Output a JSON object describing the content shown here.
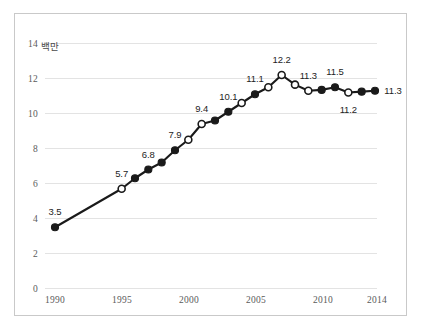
{
  "figure": {
    "background": "#ffffff",
    "frame_color": "#c9c9c9",
    "grid_color": "#e3e3e3",
    "line_color": "#1a1a1a",
    "marker_fill_color": "#1a1a1a",
    "marker_open_color": "#ffffff",
    "tick_color": "#5a5a5a"
  },
  "axis": {
    "y_unit_label": "백만",
    "y_ticks": [
      "0",
      "2",
      "4",
      "6",
      "8",
      "10",
      "12",
      "14"
    ],
    "x_ticks": [
      "1990",
      "1995",
      "2000",
      "2005",
      "2010",
      "2014"
    ]
  },
  "chart_data": {
    "type": "line",
    "title": "",
    "subtitle": "",
    "xlabel": "",
    "ylabel": "백만",
    "xlim": [
      1990,
      2014
    ],
    "ylim": [
      0,
      14
    ],
    "ytick_values": [
      0,
      2,
      4,
      6,
      8,
      10,
      12,
      14
    ],
    "xtick_values": [
      1990,
      1995,
      2000,
      2005,
      2010,
      2014
    ],
    "grid": "horizontal",
    "legend": "none",
    "series": [
      {
        "name": "백만",
        "x": [
          1990,
          1995,
          1996,
          1997,
          1998,
          1999,
          2000,
          2001,
          2002,
          2003,
          2004,
          2005,
          2006,
          2007,
          2008,
          2009,
          2010,
          2011,
          2012,
          2013,
          2014
        ],
        "values": [
          3.5,
          5.7,
          6.3,
          6.8,
          7.2,
          7.9,
          8.5,
          9.4,
          9.6,
          10.1,
          10.6,
          11.1,
          11.5,
          12.2,
          11.65,
          11.3,
          11.35,
          11.5,
          11.2,
          11.25,
          11.3
        ],
        "marker_styles": [
          "filled",
          "open",
          "filled",
          "filled",
          "filled",
          "filled",
          "open",
          "open",
          "filled",
          "filled",
          "open",
          "filled",
          "open",
          "open",
          "open",
          "open",
          "filled",
          "filled",
          "open",
          "filled",
          "filled"
        ]
      }
    ],
    "annotations": [
      {
        "text": "3.5",
        "x": 1990,
        "y": 3.5,
        "dx": 0,
        "dy": -15
      },
      {
        "text": "5.7",
        "x": 1995,
        "y": 5.7,
        "dx": 0,
        "dy": -15
      },
      {
        "text": "6.8",
        "x": 1997,
        "y": 6.8,
        "dx": 0,
        "dy": -15
      },
      {
        "text": "7.9",
        "x": 1999,
        "y": 7.9,
        "dx": 0,
        "dy": -15
      },
      {
        "text": "9.4",
        "x": 2001,
        "y": 9.4,
        "dx": 0,
        "dy": -15
      },
      {
        "text": "10.1",
        "x": 2003,
        "y": 10.1,
        "dx": 0,
        "dy": -15
      },
      {
        "text": "11.1",
        "x": 2005,
        "y": 11.1,
        "dx": 0,
        "dy": -15
      },
      {
        "text": "12.2",
        "x": 2007,
        "y": 12.2,
        "dx": 0,
        "dy": -15
      },
      {
        "text": "11.3",
        "x": 2009,
        "y": 11.3,
        "dx": 0,
        "dy": -15
      },
      {
        "text": "11.5",
        "x": 2011,
        "y": 11.5,
        "dx": 0,
        "dy": -15
      },
      {
        "text": "11.2",
        "x": 2012,
        "y": 11.2,
        "dx": 0,
        "dy": 17
      },
      {
        "text": "11.3",
        "x": 2014,
        "y": 11.3,
        "dx": 18,
        "dy": 0
      }
    ]
  },
  "labels": {
    "y0": "0",
    "y2": "2",
    "y4": "4",
    "y6": "6",
    "y8": "8",
    "y10": "10",
    "y12": "12",
    "y14": "14",
    "x1990": "1990",
    "x1995": "1995",
    "x2000": "2000",
    "x2005": "2005",
    "x2010": "2010",
    "x2014": "2014",
    "unit": "백만",
    "p3_5": "3.5",
    "p5_7": "5.7",
    "p6_8": "6.8",
    "p7_9": "7.9",
    "p9_4": "9.4",
    "p10_1": "10.1",
    "p11_1": "11.1",
    "p12_2": "12.2",
    "p11_3a": "11.3",
    "p11_5": "11.5",
    "p11_2": "11.2",
    "p11_3b": "11.3"
  }
}
